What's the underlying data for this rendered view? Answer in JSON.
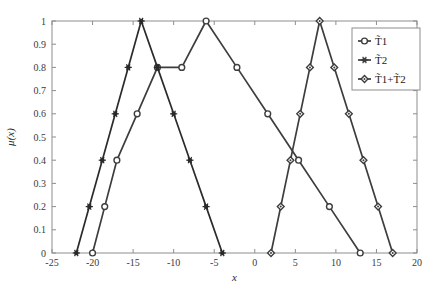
{
  "figure": {
    "background_color": "#ffffff",
    "axis_color": "#8d8d8d",
    "line_color": "#3d3d3d",
    "text_color": "#3a3a3a"
  },
  "chart_data": {
    "type": "line",
    "title": "",
    "xlabel": "x",
    "ylabel": "μ(x)",
    "xlim": [
      -25,
      20
    ],
    "ylim": [
      0,
      1
    ],
    "grid": false,
    "xticks": [
      -25,
      -20,
      -15,
      -10,
      -5,
      0,
      5,
      10,
      15,
      20
    ],
    "xticklabels": [
      "-25",
      "-20",
      "-15",
      "-10",
      "-5",
      "0",
      "5",
      "10",
      "15",
      "20"
    ],
    "yticks": [
      0,
      0.1,
      0.2,
      0.3,
      0.4,
      0.5,
      0.6,
      0.7,
      0.8,
      0.9,
      1
    ],
    "yticklabels": [
      "0",
      "0.1",
      "0.2",
      "0.3",
      "0.4",
      "0.5",
      "0.6",
      "0.7",
      "0.8",
      "0.9",
      "1"
    ],
    "legend_position": "upper right",
    "series": [
      {
        "name": "T̃1",
        "label": "T̃1",
        "marker": "circle",
        "color": "#3d3d3d",
        "points": [
          {
            "x": -20,
            "y": 0
          },
          {
            "x": -18.5,
            "y": 0.2
          },
          {
            "x": -17,
            "y": 0.4
          },
          {
            "x": -14.5,
            "y": 0.6
          },
          {
            "x": -12,
            "y": 0.8
          },
          {
            "x": -9,
            "y": 0.8
          },
          {
            "x": -6,
            "y": 1
          },
          {
            "x": -2.2,
            "y": 0.8
          },
          {
            "x": 1.6,
            "y": 0.6
          },
          {
            "x": 5.4,
            "y": 0.4
          },
          {
            "x": 9.2,
            "y": 0.2
          },
          {
            "x": 13,
            "y": 0
          }
        ]
      },
      {
        "name": "T̃2",
        "label": "T̃2",
        "marker": "star",
        "color": "#2b2b2b",
        "points": [
          {
            "x": -22,
            "y": 0
          },
          {
            "x": -20.4,
            "y": 0.2
          },
          {
            "x": -18.8,
            "y": 0.4
          },
          {
            "x": -17.2,
            "y": 0.6
          },
          {
            "x": -15.6,
            "y": 0.8
          },
          {
            "x": -14,
            "y": 1
          },
          {
            "x": -12,
            "y": 0.8
          },
          {
            "x": -10,
            "y": 0.6
          },
          {
            "x": -8,
            "y": 0.4
          },
          {
            "x": -6,
            "y": 0.2
          },
          {
            "x": -4,
            "y": 0
          }
        ]
      },
      {
        "name": "T̃1+T̃2",
        "label": "T̃1+T̃2",
        "marker": "diamond",
        "color": "#3d3d3d",
        "points": [
          {
            "x": 2,
            "y": 0
          },
          {
            "x": 3.2,
            "y": 0.2
          },
          {
            "x": 4.4,
            "y": 0.4
          },
          {
            "x": 5.6,
            "y": 0.6
          },
          {
            "x": 6.8,
            "y": 0.8
          },
          {
            "x": 8,
            "y": 1
          },
          {
            "x": 9.8,
            "y": 0.8
          },
          {
            "x": 11.6,
            "y": 0.6
          },
          {
            "x": 13.4,
            "y": 0.4
          },
          {
            "x": 15.2,
            "y": 0.2
          },
          {
            "x": 17,
            "y": 0
          }
        ]
      }
    ],
    "legend_entries": [
      {
        "label": "T̃1",
        "marker": "circle"
      },
      {
        "label": "T̃2",
        "marker": "star"
      },
      {
        "label": "T̃1+T̃2",
        "marker": "diamond"
      }
    ]
  }
}
